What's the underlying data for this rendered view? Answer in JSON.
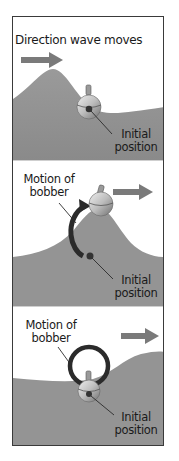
{
  "colors": {
    "water": "#8e8e8e",
    "water_light": "#a6a6a6",
    "arrow": "#7a7a7a",
    "motion_path": "#2b2b2b",
    "frame": "#3a3a3a",
    "text": "#1a1a1a"
  },
  "panels": [
    {
      "title": "Direction wave moves",
      "initial_label_line1": "Initial",
      "initial_label_line2": "position",
      "icons": [
        "direction-arrow-icon",
        "bobber-icon",
        "initial-position-dot-icon",
        "leader-line-icon"
      ]
    },
    {
      "motion_label_line1": "Motion of",
      "motion_label_line2": "bobber",
      "initial_label_line1": "Initial",
      "initial_label_line2": "position",
      "icons": [
        "direction-arrow-icon",
        "bobber-icon",
        "motion-arc-arrow-icon",
        "initial-position-dot-icon"
      ]
    },
    {
      "motion_label_line1": "Motion of",
      "motion_label_line2": "bobber",
      "initial_label_line1": "Initial",
      "initial_label_line2": "position",
      "icons": [
        "direction-arrow-icon",
        "bobber-icon",
        "motion-circle-icon",
        "initial-position-dot-icon"
      ]
    }
  ]
}
